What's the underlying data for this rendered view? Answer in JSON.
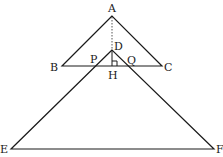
{
  "diagram": {
    "type": "geometry",
    "stroke_color": "#1a1a1a",
    "points": {
      "A": {
        "label": "A",
        "x": 112,
        "y": 16
      },
      "B": {
        "label": "B",
        "x": 62,
        "y": 66
      },
      "C": {
        "label": "C",
        "x": 162,
        "y": 66
      },
      "D": {
        "label": "D",
        "x": 112,
        "y": 50
      },
      "H": {
        "label": "H",
        "x": 112,
        "y": 66
      },
      "P": {
        "label": "P",
        "x": 95,
        "y": 66
      },
      "Q": {
        "label": "Q",
        "x": 129,
        "y": 66
      },
      "E": {
        "label": "E",
        "x": 11,
        "y": 149
      },
      "F": {
        "label": "F",
        "x": 214,
        "y": 149
      }
    },
    "segments": [
      {
        "from": "A",
        "to": "B",
        "style": "solid"
      },
      {
        "from": "A",
        "to": "C",
        "style": "solid"
      },
      {
        "from": "B",
        "to": "C",
        "style": "solid"
      },
      {
        "from": "D",
        "to": "E",
        "style": "solid"
      },
      {
        "from": "D",
        "to": "F",
        "style": "solid"
      },
      {
        "from": "E",
        "to": "F",
        "style": "solid"
      },
      {
        "from": "A",
        "to": "D",
        "style": "dotted"
      },
      {
        "from": "D",
        "to": "H",
        "style": "solid"
      }
    ],
    "right_angle_marker": {
      "at": "H",
      "label": "DH ⊥ BC"
    }
  }
}
